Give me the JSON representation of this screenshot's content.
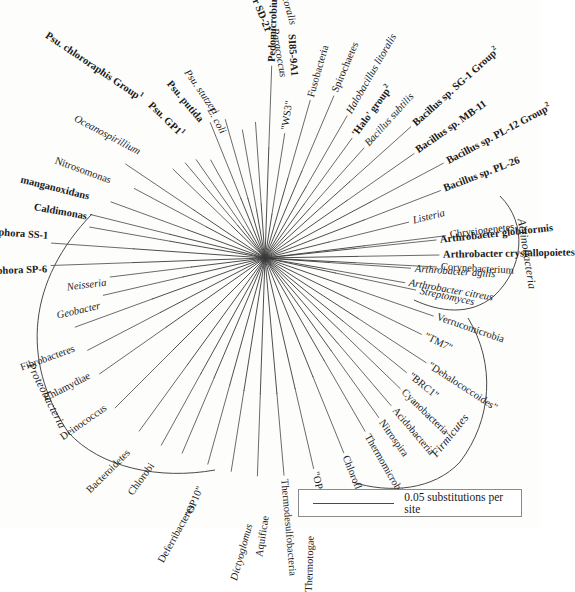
{
  "figure": {
    "type": "unrooted-radial-phylogenetic-tree",
    "center": [
      265,
      258
    ],
    "line_color": "#3a3a3a",
    "text_color": "#1a1a1a",
    "background": "#fdfdfb"
  },
  "scale_bar": {
    "label": "0.05 substitutions per site",
    "value": 0.05,
    "units": "substitutions per site"
  },
  "clade_arcs": [
    {
      "name": "Proteobacteria",
      "label": "Proteobacteria",
      "style": "italic",
      "label_x": 30,
      "label_y": 360,
      "label_rot": 62
    },
    {
      "name": "Actinobacteria",
      "label": "Actinobacteria",
      "style": "italic",
      "label_x": 519,
      "label_y": 212,
      "label_rot": 80
    },
    {
      "name": "Firmicutes",
      "label": "Firmicutes",
      "style": "italic",
      "label_x": 437,
      "label_y": 447,
      "label_rot": -50
    }
  ],
  "chart_data": {
    "type": "tree",
    "root": "unrooted-center-node",
    "scale": "0.05 substitutions per site",
    "taxa": [
      {
        "label": "Bacteroidetes",
        "style": "reg",
        "angle": 225.0,
        "r": 216
      },
      {
        "label": "Chlorobi",
        "style": "reg",
        "angle": 234.0,
        "r": 218
      },
      {
        "label": "Deferribacteres",
        "style": "reg",
        "angle": 241.0,
        "r": 218
      },
      {
        "label": "\"OP10\"",
        "style": "reg",
        "angle": 247.0,
        "r": 216
      },
      {
        "label": "Dictyoglomus",
        "style": "ital",
        "angle": 254.5,
        "r": 218
      },
      {
        "label": "Aquificae",
        "style": "reg",
        "angle": 261.0,
        "r": 220
      },
      {
        "label": "Thermotogae",
        "style": "reg",
        "angle": 268.0,
        "r": 222
      },
      {
        "label": "Thermodesulfobacteria",
        "style": "reg",
        "angle": 275.0,
        "r": 222
      },
      {
        "label": "\"OP11\"",
        "style": "reg",
        "angle": 283.0,
        "r": 220
      },
      {
        "label": "Chloroflexi",
        "style": "reg",
        "angle": 292.0,
        "r": 214
      },
      {
        "label": "Thermomicrobia",
        "style": "reg",
        "angle": 300.0,
        "r": 204
      },
      {
        "label": "Nitrospira",
        "style": "reg",
        "angle": 305.5,
        "r": 200
      },
      {
        "label": "Acidobacteria",
        "style": "reg",
        "angle": 310.5,
        "r": 198
      },
      {
        "label": "Cyanobacteria",
        "style": "reg",
        "angle": 316.0,
        "r": 192
      },
      {
        "label": "\"BRC1\"",
        "style": "reg",
        "angle": 321.0,
        "r": 186
      },
      {
        "label": "\"Dehalococcoides\"",
        "style": "reg",
        "angle": 327.0,
        "r": 196
      },
      {
        "label": "\"TM7\"",
        "style": "reg",
        "angle": 334.0,
        "r": 178
      },
      {
        "label": "Verrucomicrobia",
        "style": "reg",
        "angle": 341.0,
        "r": 182
      },
      {
        "label": "Deinococcus",
        "style": "reg",
        "angle": 215.0,
        "r": 206
      },
      {
        "label": "Chlamydiae",
        "style": "reg",
        "angle": 207.5,
        "r": 204
      },
      {
        "label": "Fibrobacteres",
        "style": "reg",
        "angle": 200.0,
        "r": 206
      },
      {
        "label": "Geobacter",
        "style": "ital",
        "angle": 193.0,
        "r": 170
      },
      {
        "label": "Neisseria",
        "style": "ital",
        "angle": 187.0,
        "r": 160
      },
      {
        "label": "Lept. discophora SP-6",
        "style": "bold",
        "angle": 182.0,
        "r": 218
      },
      {
        "label": "Lept. discophora SS-1",
        "style": "bold",
        "angle": 176.0,
        "r": 218
      },
      {
        "label": "Caldimonas",
        "style": "bold",
        "angle": 170.0,
        "r": 182
      },
      {
        "label": "manganoxidans",
        "style": "bold",
        "angle": 166.0,
        "r": 184
      },
      {
        "label": "Nitrosomonas",
        "style": "reg",
        "angle": 160.0,
        "r": 168
      },
      {
        "label": "Oceanospirillium",
        "style": "ital",
        "angle": 152.0,
        "r": 152
      },
      {
        "label": "Psu. chlororaphis Group",
        "sup": "1",
        "style": "bold",
        "angle": 146.0,
        "r": 172
      },
      {
        "label": "Psu. GP1",
        "sup": "1",
        "style": "bold",
        "angle": 136.0,
        "r": 132
      },
      {
        "label": "Psu. putida",
        "style": "bold",
        "angle": 130.0,
        "r": 128
      },
      {
        "label": "Psu. stutzeri",
        "style": "ital",
        "angle": 125.0,
        "r": 124
      },
      {
        "label": "E. coli",
        "style": "ital",
        "angle": 119.0,
        "r": 116
      },
      {
        "label": "Erythrobacter SD-21",
        "style": "bold",
        "angle": 112.0,
        "r": 150
      },
      {
        "label": "Erythrobacter litoralis",
        "style": "ital",
        "angle": 106.0,
        "r": 148
      },
      {
        "label": "Paracoccus",
        "style": "ital",
        "angle": 100.0,
        "r": 134
      },
      {
        "label": "SI85-9A1",
        "style": "bold",
        "angle": 94.0,
        "r": 140
      },
      {
        "label": "Pedomicrobium manganicum",
        "style": "bold",
        "angle": 88.0,
        "r": 196
      },
      {
        "label": "\"WS3\"",
        "style": "reg",
        "angle": 81.0,
        "r": 130
      },
      {
        "label": "Fusobacteria",
        "style": "reg",
        "angle": 74.0,
        "r": 168
      },
      {
        "label": "Spirochaetes",
        "style": "reg",
        "angle": 67.0,
        "r": 180
      },
      {
        "label": "Halobacillus litoralis",
        "style": "ital",
        "angle": 60.0,
        "r": 168
      },
      {
        "label": "'Halo' group",
        "sup": "2",
        "style": "bold",
        "angle": 54.0,
        "r": 152
      },
      {
        "label": "Bacillus subtilis",
        "style": "ital",
        "angle": 48.0,
        "r": 152
      },
      {
        "label": "Bacillus sp. SG-1 Group",
        "sup": "2",
        "style": "bold",
        "angle": 42.0,
        "r": 200
      },
      {
        "label": "Bacillus sp. MB-11",
        "style": "bold",
        "angle": 35.0,
        "r": 186
      },
      {
        "label": "Bacillus sp. PL-12 Group",
        "sup": "2",
        "style": "bold",
        "angle": 28.0,
        "r": 206
      },
      {
        "label": "Bacillus sp. PL-26",
        "style": "bold",
        "angle": 21.0,
        "r": 192
      },
      {
        "label": "Listeria",
        "style": "ital",
        "angle": 14.0,
        "r": 152
      },
      {
        "label": "Chrysiogenetes",
        "style": "reg",
        "angle": 7.0,
        "r": 186
      },
      {
        "label": "Corynebacterium",
        "style": "reg",
        "angle": 357.0,
        "r": 176
      },
      {
        "label": "Arthrobacter citreus",
        "style": "ital",
        "angle": 350.0,
        "r": 146
      },
      {
        "label": "Arthrobacter agilis",
        "style": "ital",
        "angle": 356.0,
        "r": 150
      },
      {
        "label": "Arthrobacter crystallopoietes",
        "style": "bold",
        "angle": 1.0,
        "r": 178
      },
      {
        "label": "Arthrobacter globiformis",
        "style": "bold",
        "angle": 6.0,
        "r": 176
      },
      {
        "label": "Streptomyces",
        "style": "ital",
        "angle": 348.0,
        "r": 158
      }
    ]
  },
  "labels": {
    "bacteroidetes": "Bacteroidetes",
    "chlorobi": "Chlorobi",
    "deferribacteres": "Deferribacteres",
    "op10": "\"OP10\"",
    "dictyoglomus": "Dictyoglomus",
    "aquificae": "Aquificae",
    "thermotogae": "Thermotogae",
    "thermodesulfobacteria": "Thermodesulfobacteria",
    "op11": "\"OP11\"",
    "chloroflexi": "Chloroflexi",
    "thermomicrobia": "Thermomicrobia",
    "nitrospira": "Nitrospira",
    "acidobacteria": "Acidobacteria",
    "cyanobacteria": "Cyanobacteria",
    "brc1": "\"BRC1\"",
    "dehalococcoides": "\"Dehalococcoides\"",
    "tm7": "\"TM7\"",
    "verrucomicrobia": "Verrucomicrobia",
    "deinococcus": "Deinococcus",
    "chlamydiae": "Chlamydiae",
    "fibrobacteres": "Fibrobacteres",
    "geobacter": "Geobacter",
    "neisseria": "Neisseria",
    "lept_sp6": "Lept. discophora SP-6",
    "lept_ss1": "Lept. discophora SS-1",
    "caldimonas": "Caldimonas",
    "manganoxidans": "manganoxidans",
    "nitrosomonas": "Nitrosomonas",
    "oceanospirillium": "Oceanospirillium",
    "psu_chlororaphis": "Psu. chlororaphis Group",
    "psu_chlororaphis_sup": "1",
    "psu_gp1": "Psu. GP1",
    "psu_gp1_sup": "1",
    "psu_putida": "Psu. putida",
    "psu_stutzeri": "Psu. stutzeri",
    "e_coli": "E. coli",
    "erythrobacter_sd21": "Erythrobacter SD-21",
    "erythrobacter_litoralis": "Erythrobacter litoralis",
    "paracoccus": "Paracoccus",
    "si85": "SI85-9A1",
    "pedomicrobium": "Pedomicrobium manganicum",
    "ws3": "\"WS3\"",
    "fusobacteria": "Fusobacteria",
    "spirochaetes": "Spirochaetes",
    "halobacillus": "Halobacillus litoralis",
    "halo_group": "'Halo' group",
    "halo_group_sup": "2",
    "bacillus_subtilis": "Bacillus subtilis",
    "bacillus_sg1": "Bacillus sp. SG-1 Group",
    "bacillus_sg1_sup": "2",
    "bacillus_mb11": "Bacillus sp. MB-11",
    "bacillus_pl12": "Bacillus sp. PL-12 Group",
    "bacillus_pl12_sup": "2",
    "bacillus_pl26": "Bacillus sp. PL-26",
    "listeria": "Listeria",
    "chrysiogenetes": "Chrysiogenetes",
    "corynebacterium": "Corynebacterium",
    "arthrobacter_citreus": "Arthrobacter citreus",
    "arthrobacter_agilis": "Arthrobacter agilis",
    "arthrobacter_crystallopoietes": "Arthrobacter crystallopoietes",
    "arthrobacter_globiformis": "Arthrobacter globiformis",
    "streptomyces": "Streptomyces",
    "clade_proteobacteria": "Proteobacteria",
    "clade_actinobacteria": "Actinobacteria",
    "clade_firmicutes": "Firmicutes",
    "scale_text": "0.05 substitutions per site"
  }
}
